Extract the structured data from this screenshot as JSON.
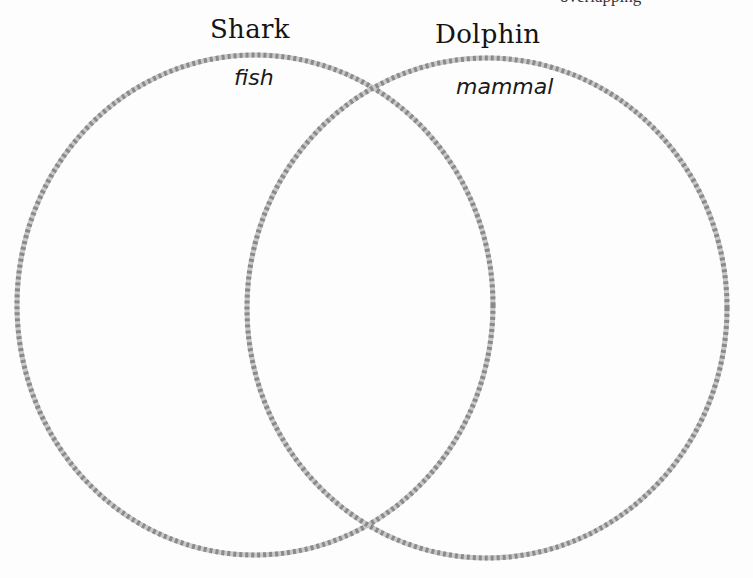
{
  "diagram": {
    "type": "venn",
    "top_cut_text": "overlapping",
    "stroke_color": "#8c8c8c",
    "stroke_dash_color": "#c8c8c8",
    "sets": [
      {
        "title": "Shark",
        "items": [
          "fish"
        ],
        "circle": {
          "cx": 255,
          "cy": 305,
          "rx": 238,
          "ry": 250
        }
      },
      {
        "title": "Dolphin",
        "items": [
          "mammal"
        ],
        "circle": {
          "cx": 487,
          "cy": 308,
          "rx": 240,
          "ry": 250
        }
      }
    ],
    "overlap_items": []
  }
}
